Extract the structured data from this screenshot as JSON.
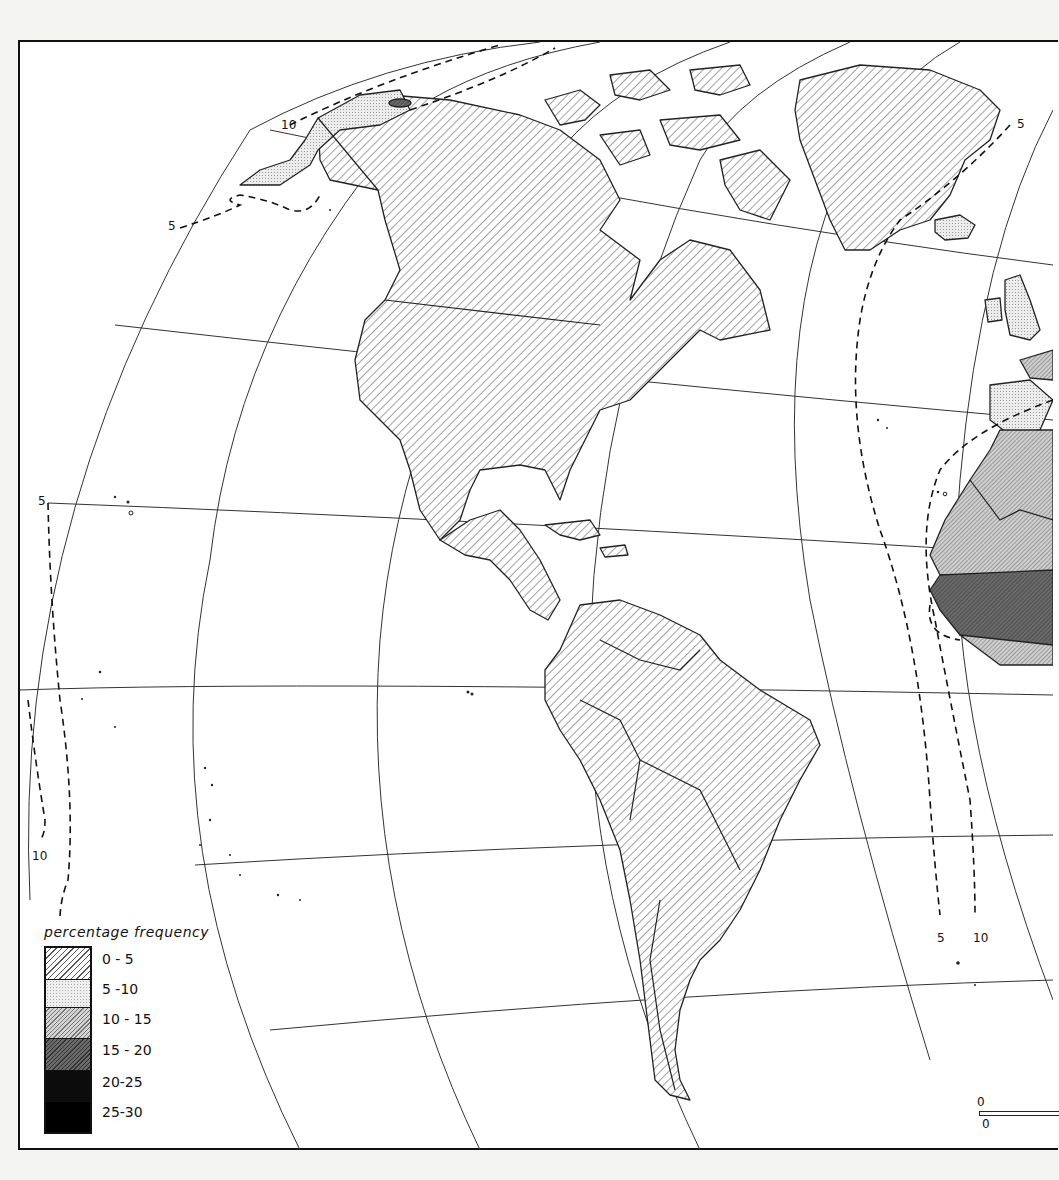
{
  "map": {
    "title": "",
    "projection": "oblique azimuthal (Americas / Atlantic)",
    "regions_shown": [
      "North America",
      "Greenland",
      "Central America",
      "Caribbean",
      "South America",
      "Iceland",
      "British Isles",
      "Iberia",
      "West Africa"
    ],
    "colors": {
      "background": "#ffffff",
      "outline": "#111111",
      "class_0_5": "hatched-light",
      "class_5_10": "#e6e6e6",
      "class_10_15": "#bdbdbd",
      "class_15_20": "#6e6e6e",
      "class_20_25": "#111111",
      "class_25_30": "#000000"
    }
  },
  "legend": {
    "title": "percentage frequency",
    "classes": [
      {
        "label": "0 - 5",
        "fill": "hatch-light"
      },
      {
        "label": "5 -10",
        "fill": "stipple"
      },
      {
        "label": "10 - 15",
        "fill": "hatch-medium"
      },
      {
        "label": "15 - 20",
        "fill": "hatch-dark"
      },
      {
        "label": "20-25",
        "fill": "black"
      },
      {
        "label": "25-30",
        "fill": "black"
      }
    ]
  },
  "isoline_labels": [
    {
      "text": "10",
      "x": 281,
      "y": 119
    },
    {
      "text": "5",
      "x": 168,
      "y": 220
    },
    {
      "text": "5",
      "x": 1017,
      "y": 118
    },
    {
      "text": "5",
      "x": 38,
      "y": 495
    },
    {
      "text": "10",
      "x": 32,
      "y": 850
    },
    {
      "text": "5",
      "x": 937,
      "y": 932
    },
    {
      "text": "10",
      "x": 973,
      "y": 932
    }
  ],
  "region_classes": [
    {
      "region": "Canada & USA",
      "class": "0 - 5"
    },
    {
      "region": "Western Alaska",
      "class": "5 -10"
    },
    {
      "region": "Northern Alaska spot",
      "class": "0 - 5"
    },
    {
      "region": "Greenland",
      "class": "0 - 5"
    },
    {
      "region": "Mexico & Central America",
      "class": "0 - 5"
    },
    {
      "region": "South America",
      "class": "0 - 5"
    },
    {
      "region": "Iceland",
      "class": "5 -10"
    },
    {
      "region": "British Isles & Iberia",
      "class": "5 -10"
    },
    {
      "region": "Northwest Africa",
      "class": "10 - 15"
    },
    {
      "region": "West Africa (Sahel/Guinea)",
      "class": "15 - 20"
    }
  ],
  "scale": {
    "top_label": "0",
    "bottom_label": "0"
  }
}
